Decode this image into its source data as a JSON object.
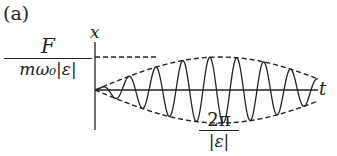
{
  "figure": {
    "panel_label": "(a)",
    "amplitude_label": {
      "numerator": "F",
      "denominator": "mω₀|ε|"
    },
    "y_axis_label": "x",
    "x_axis_label": "t",
    "beat_period_label": {
      "numerator": "2π",
      "denominator": "|ε|"
    }
  },
  "plot": {
    "origin_px": [
      95,
      90
    ],
    "envelope_amplitude_px": 33,
    "beat_period_px": 250,
    "carrier_period_px": 27,
    "axis_end_px": 318,
    "stroke_color": "#222222"
  }
}
